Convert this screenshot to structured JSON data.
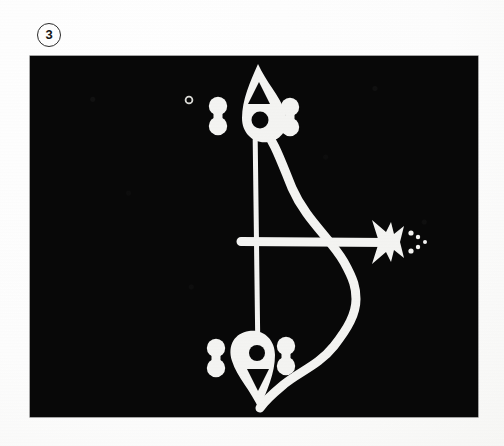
{
  "figure": {
    "number_label": "3",
    "badge_shape": "circle",
    "caption": "",
    "plate": {
      "background_color": "#080808",
      "ink_color": "#f4f4f2",
      "left": 30,
      "top": 56,
      "width": 448,
      "height": 361
    }
  },
  "page": {
    "background_color": "#ffffff",
    "width": 504,
    "height": 446
  },
  "drawing": {
    "title": "bow-and-arrow ideogram",
    "description": "White line ideogram on black plate: a vertical bowstring with teardrop/flame terminals at top and bottom, a curved bow limb to the right, a horizontal arrow shaft ending in a notched trident arrowhead with three trailing dots, and paired dumbbell marks flanking each terminal.",
    "elements": [
      {
        "name": "top-teardrop-terminal",
        "kind": "teardrop",
        "holes": [
          "triangle",
          "circle"
        ]
      },
      {
        "name": "bottom-teardrop-terminal",
        "kind": "teardrop-inverted",
        "holes": [
          "circle",
          "triangle"
        ]
      },
      {
        "name": "bowstring",
        "kind": "vertical-line"
      },
      {
        "name": "bow-limb",
        "kind": "curve"
      },
      {
        "name": "arrow-shaft",
        "kind": "horizontal-line"
      },
      {
        "name": "arrowhead",
        "kind": "notched-trident"
      },
      {
        "name": "arrow-trail-dots",
        "kind": "dots",
        "count": 3
      },
      {
        "name": "dumbbell-top-left",
        "kind": "dumbbell"
      },
      {
        "name": "dumbbell-top-right",
        "kind": "dumbbell"
      },
      {
        "name": "dumbbell-bottom-left",
        "kind": "dumbbell"
      },
      {
        "name": "dumbbell-bottom-right",
        "kind": "dumbbell"
      },
      {
        "name": "small-ring-mark",
        "kind": "ring"
      }
    ]
  }
}
